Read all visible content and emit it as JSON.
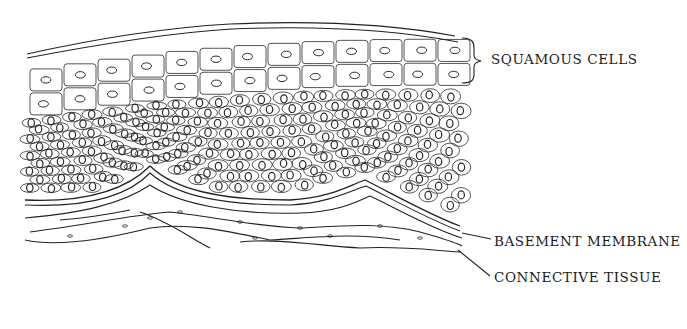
{
  "figure": {
    "type": "histology line drawing",
    "labels": {
      "squamous_cells": "SQUAMOUS CELLS",
      "basement_membrane": "BASEMENT MEMBRANE",
      "connective_tissue": "CONNECTIVE TISSUE"
    },
    "colors": {
      "ink": "#222222",
      "background": "#ffffff"
    }
  }
}
